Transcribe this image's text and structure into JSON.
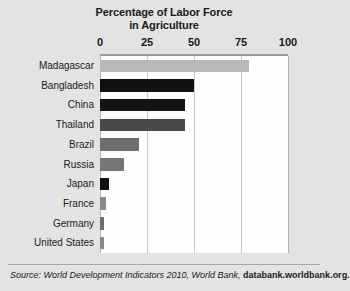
{
  "chart_data": {
    "type": "bar",
    "orientation": "horizontal",
    "title": "Percentage of Labor Force in Agriculture",
    "title_lines": [
      "Percentage of Labor Force",
      "in Agriculture"
    ],
    "xlabel": "",
    "ylabel": "",
    "xlim": [
      0,
      100
    ],
    "xticks": [
      0,
      25,
      50,
      75,
      100
    ],
    "xtick_labels": [
      "0",
      "25",
      "50",
      "75",
      "100"
    ],
    "grid": true,
    "grid_axis": "x",
    "legend": false,
    "categories": [
      "Madagascar",
      "Bangladesh",
      "China",
      "Thailand",
      "Brazil",
      "Russia",
      "Japan",
      "France",
      "Germany",
      "United States"
    ],
    "values": [
      79,
      50,
      45,
      45,
      21,
      13,
      5,
      3,
      2,
      2
    ],
    "bar_colors": [
      "#b8b8b8",
      "#111111",
      "#131313",
      "#4a4a4a",
      "#6e6e6e",
      "#767676",
      "#111111",
      "#8a8a8a",
      "#6e6e6e",
      "#8a8a8a"
    ]
  },
  "source": {
    "prefix": "Source: World Development Indicators 2010, World Bank, ",
    "url": "databank.worldbank.org."
  },
  "colors": {
    "background": "#e3e3e3",
    "plot_background": "#fdfdfd",
    "gridline": "#c8c8c8",
    "text": "#1a1a1a"
  }
}
